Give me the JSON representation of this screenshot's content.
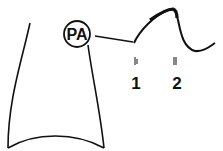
{
  "diagram": {
    "pa_label": "PA",
    "markers": [
      {
        "label": "1"
      },
      {
        "label": "2"
      }
    ],
    "colors": {
      "stroke": "#111111",
      "background": "#ffffff"
    }
  }
}
